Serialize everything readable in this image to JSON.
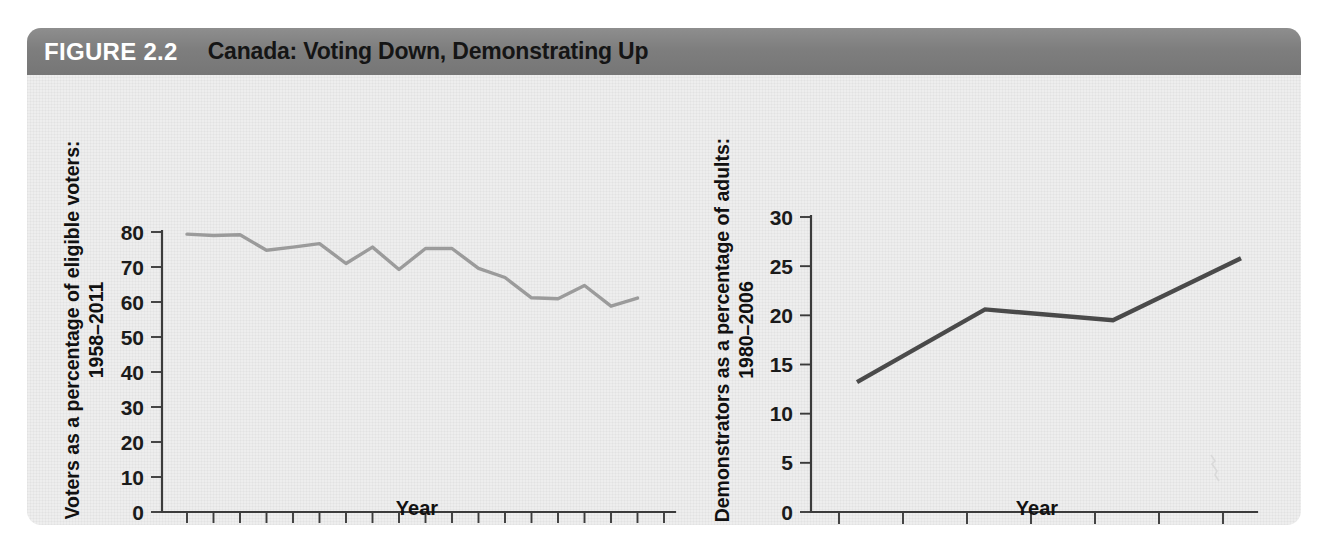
{
  "figure": {
    "number_label": "FIGURE 2.2",
    "title": "Canada: Voting Down, Demonstrating Up",
    "banner_color": "#7e7e7e",
    "panel_color": "#eeeeee"
  },
  "chart_data": [
    {
      "id": "voter-turnout",
      "type": "line",
      "title": "",
      "xlabel": "Year",
      "ylabel_line1": "Voters as a percentage of eligible voters:",
      "ylabel_line2": "1958–2011",
      "ylim": [
        0,
        80
      ],
      "yticks": [
        0,
        10,
        20,
        30,
        40,
        50,
        60,
        70,
        80
      ],
      "ytick_labels": [
        "0",
        "10",
        "20",
        "30",
        "40",
        "50",
        "60",
        "70",
        "80"
      ],
      "grid": false,
      "legend": "none",
      "line_color": "#9b9b9b",
      "categories": [
        "1958",
        "1962",
        "1963",
        "1965",
        "1968",
        "1972",
        "1974",
        "1979",
        "1980",
        "1984",
        "1988",
        "1993",
        "1997",
        "2000",
        "2004",
        "2006",
        "2008",
        "2011"
      ],
      "xtick_labels_shown": [
        "1958",
        "1963",
        "1968",
        "1974",
        "1980",
        "1988",
        "1997",
        "2004",
        "2008"
      ],
      "values": [
        79.4,
        79.0,
        79.2,
        74.8,
        75.7,
        76.7,
        71.0,
        75.7,
        69.3,
        75.3,
        75.3,
        69.6,
        67.0,
        61.2,
        60.9,
        64.7,
        58.8,
        61.1
      ]
    },
    {
      "id": "demonstrators",
      "type": "line",
      "title": "",
      "xlabel": "Year",
      "ylabel_line1": "Demonstrators as a percentage of adults:",
      "ylabel_line2": "1980–2006",
      "ylim": [
        0,
        30
      ],
      "yticks": [
        0,
        5,
        10,
        15,
        20,
        25,
        30
      ],
      "ytick_labels": [
        "0",
        "5",
        "10",
        "15",
        "20",
        "25",
        "30"
      ],
      "grid": false,
      "legend": "none",
      "line_color": "#4a4a4a",
      "categories": [
        "1980",
        "1990",
        "2000",
        "2006"
      ],
      "xtick_labels_shown": [
        "1980",
        "1990",
        "2000",
        "2006"
      ],
      "values": [
        13.2,
        20.6,
        19.5,
        25.8
      ]
    }
  ]
}
